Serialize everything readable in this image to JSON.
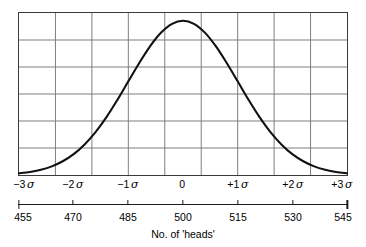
{
  "chart_data": {
    "type": "line",
    "title": "",
    "subtitle": "",
    "xlabel": "No. of 'heads'",
    "ylabel": "",
    "grid": true,
    "legend": false,
    "legend_position": "none",
    "xlim": [
      -3,
      3
    ],
    "ylim": [
      0,
      1.05
    ],
    "x_grid_values": [
      -3.0,
      -2.3333,
      -1.6667,
      -1.0,
      -0.3333,
      0.3333,
      1.0,
      1.6667,
      2.3333,
      3.0
    ],
    "y_grid_count": 6,
    "sigma_axis": {
      "name": "standard deviations",
      "ticks": [
        -3,
        -2,
        -1,
        0,
        1,
        2,
        3
      ],
      "labels": [
        "−3",
        "−2",
        "−1",
        "0",
        "+1",
        "+2",
        "+3"
      ],
      "unit_symbol": "σ"
    },
    "value_axis": {
      "name": "No. of 'heads'",
      "ticks": [
        455,
        470,
        485,
        500,
        515,
        530,
        545
      ],
      "labels": [
        "455",
        "470",
        "485",
        "500",
        "515",
        "530",
        "545"
      ],
      "mean": 500,
      "sigma_in_units": 15,
      "min": 455,
      "max": 545
    },
    "series": [
      {
        "name": "normal curve",
        "x": [
          -3.0,
          -2.8,
          -2.6,
          -2.4,
          -2.2,
          -2.0,
          -1.8,
          -1.6,
          -1.4,
          -1.2,
          -1.0,
          -0.8,
          -0.6,
          -0.4,
          -0.2,
          0.0,
          0.2,
          0.4,
          0.6,
          0.8,
          1.0,
          1.2,
          1.4,
          1.6,
          1.8,
          2.0,
          2.2,
          2.4,
          2.6,
          2.8,
          3.0
        ],
        "y": [
          0.011,
          0.019,
          0.034,
          0.056,
          0.089,
          0.135,
          0.198,
          0.278,
          0.375,
          0.487,
          0.607,
          0.726,
          0.835,
          0.923,
          0.98,
          1.0,
          0.98,
          0.923,
          0.835,
          0.726,
          0.607,
          0.487,
          0.375,
          0.278,
          0.198,
          0.135,
          0.089,
          0.056,
          0.034,
          0.019,
          0.011
        ],
        "color": "#111111",
        "line_width": 2.1
      }
    ],
    "colors": {
      "curve": "#111111",
      "frame": "#3a3a3a",
      "grid": "#7d7d7d",
      "text": "#000000",
      "background": "#ffffff"
    }
  }
}
